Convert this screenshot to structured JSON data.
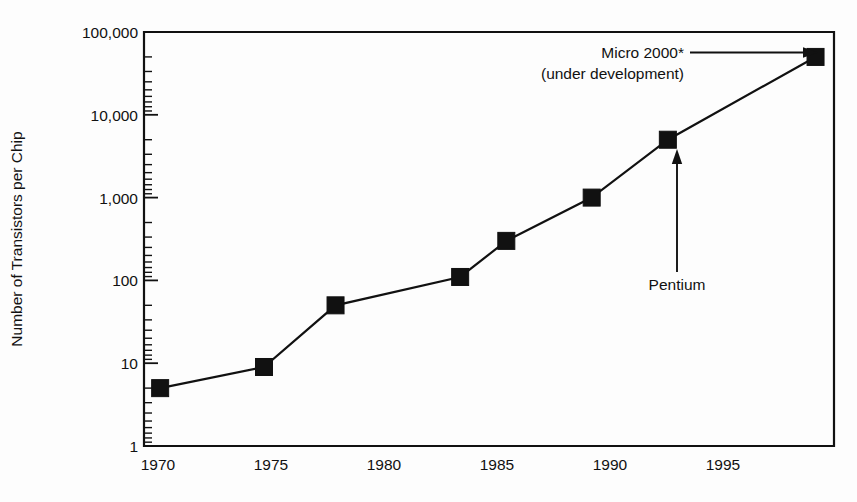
{
  "chart_data": {
    "type": "line",
    "title": "",
    "xlabel": "",
    "ylabel": "Number of Transistors per Chip",
    "x": [
      1970,
      1974.5,
      1977.6,
      1983,
      1985,
      1988.7,
      1992,
      1998.4
    ],
    "values": [
      5,
      9,
      50,
      110,
      300,
      1000,
      5000,
      50000
    ],
    "series": [
      {
        "name": "Transistors per chip",
        "x": [
          1970,
          1974.5,
          1977.6,
          1983,
          1985,
          1988.7,
          1992,
          1998.4
        ],
        "values": [
          5,
          9,
          50,
          110,
          300,
          1000,
          5000,
          50000
        ]
      }
    ],
    "xlim": [
      1969.3,
      1999.2
    ],
    "ylim": [
      1,
      100000
    ],
    "yscale": "log",
    "xscale": "linear",
    "grid": false,
    "legend": false,
    "legend_position": "none",
    "xticks": [
      1970,
      1975,
      1980,
      1985,
      1990,
      1995
    ],
    "xticklabels": [
      "1970",
      "1975",
      "1980",
      "1985",
      "1990",
      "1995"
    ],
    "yticks": [
      1,
      10,
      100,
      1000,
      10000,
      100000
    ],
    "yticklabels": [
      "1",
      "10",
      "100",
      "1,000",
      "10,000",
      "100,000"
    ],
    "marker": "square",
    "marker_color": "#111111",
    "line_color": "#111111",
    "annotations": [
      {
        "name": "micro-2000",
        "lines": [
          "Micro 2000*",
          "(under development)"
        ],
        "text": "Micro 2000* (under development)",
        "arrow": "right",
        "target_x": 1998.4,
        "target_y": 50000
      },
      {
        "name": "pentium",
        "lines": [
          "Pentium"
        ],
        "text": "Pentium",
        "arrow": "up",
        "target_x": 1992,
        "target_y": 5000
      }
    ]
  },
  "axes": {
    "y_title": "Number of Transistors per Chip",
    "y_ticklabels": [
      "100,000",
      "10,000",
      "1,000",
      "100",
      "10",
      "1"
    ],
    "x_ticklabels": [
      "1970",
      "1975",
      "1980",
      "1985",
      "1990",
      "1995"
    ]
  },
  "annotations": {
    "micro_line1": "Micro 2000*",
    "micro_line2": "(under development)",
    "pentium": "Pentium"
  },
  "colors": {
    "ink": "#111111",
    "background": "#fdfdfd"
  }
}
